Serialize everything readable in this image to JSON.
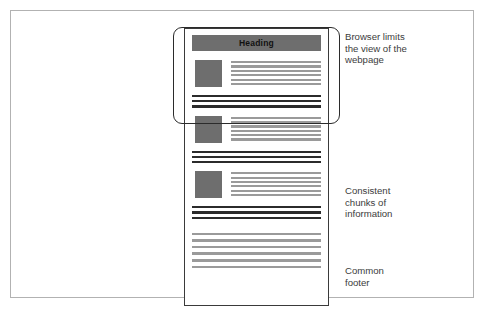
{
  "diagram": {
    "colors": {
      "canvas_border": "#b2b2b2",
      "page_border": "#3a3a3a",
      "heading_fill": "#6e6e6e",
      "image_fill": "#6e6e6e",
      "text_line": "#9a9a9a",
      "separator_bar": "#2b2b2b",
      "browser_frame": "#2b2b2b",
      "annotation_text": "#3c3c3c",
      "background": "#ffffff"
    }
  },
  "webpage": {
    "heading": {
      "label": "Heading"
    },
    "chunks": [
      {
        "name": "content-chunk-1",
        "image_placeholder": "image-block",
        "text_line_count": 6,
        "separator_bar_count": 3
      },
      {
        "name": "content-chunk-2",
        "image_placeholder": "image-block",
        "text_line_count": 6,
        "separator_bar_count": 3
      },
      {
        "name": "content-chunk-3",
        "image_placeholder": "image-block",
        "text_line_count": 6,
        "separator_bar_count": 3
      }
    ],
    "footer": {
      "name": "common-footer",
      "line_count": 6
    }
  },
  "browser_frame": {
    "name": "browser-viewport-outline"
  },
  "annotations": [
    {
      "id": "browser-limits",
      "text": "Browser limits\nthe view of the\nwebpage"
    },
    {
      "id": "consistent-chunks",
      "text": "Consistent\nchunks of\ninformation"
    },
    {
      "id": "common-footer",
      "text": "Common\nfooter"
    }
  ]
}
